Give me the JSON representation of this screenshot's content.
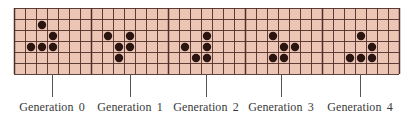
{
  "figure": {
    "grid": {
      "left": 14,
      "top": 8,
      "cell_size": 11,
      "cols": 35,
      "rows": 6,
      "panel_cols": 7,
      "fill_color": "#ecc5b5",
      "line_color": "#4e2e28",
      "dot_color": "#2b1510"
    },
    "generations": [
      {
        "label": "Generation  0",
        "leader_x": 52,
        "cells": [
          [
            2,
            1
          ],
          [
            3,
            2
          ],
          [
            1,
            3
          ],
          [
            2,
            3
          ],
          [
            3,
            3
          ]
        ]
      },
      {
        "label": "Generation  1",
        "leader_x": 130,
        "cells": [
          [
            8,
            2
          ],
          [
            10,
            2
          ],
          [
            9,
            3
          ],
          [
            10,
            3
          ],
          [
            9,
            4
          ]
        ]
      },
      {
        "label": "Generation  2",
        "leader_x": 206,
        "cells": [
          [
            17,
            2
          ],
          [
            15,
            3
          ],
          [
            17,
            3
          ],
          [
            16,
            4
          ],
          [
            17,
            4
          ]
        ]
      },
      {
        "label": "Generation  3",
        "leader_x": 281,
        "cells": [
          [
            23,
            2
          ],
          [
            24,
            3
          ],
          [
            25,
            3
          ],
          [
            23,
            4
          ],
          [
            24,
            4
          ]
        ]
      },
      {
        "label": "Generation  4",
        "leader_x": 360,
        "cells": [
          [
            31,
            2
          ],
          [
            32,
            3
          ],
          [
            30,
            4
          ],
          [
            31,
            4
          ],
          [
            32,
            4
          ]
        ]
      }
    ]
  }
}
